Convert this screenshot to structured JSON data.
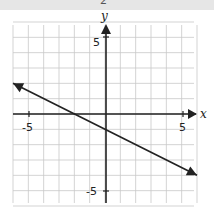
{
  "page": {
    "top_label": "2"
  },
  "chart_data": {
    "type": "line",
    "title": "",
    "xlabel": "x",
    "ylabel": "y",
    "xlim": [
      -6,
      6
    ],
    "ylim": [
      -6,
      6
    ],
    "grid": true,
    "tick_labels": {
      "x": [
        "-5",
        "5"
      ],
      "y": [
        "5",
        "-5"
      ]
    },
    "series": [
      {
        "name": "line",
        "x": [
          -6,
          6
        ],
        "y": [
          2,
          -4
        ],
        "arrows": "both",
        "equation": "y = -x/2 - 1"
      }
    ]
  }
}
